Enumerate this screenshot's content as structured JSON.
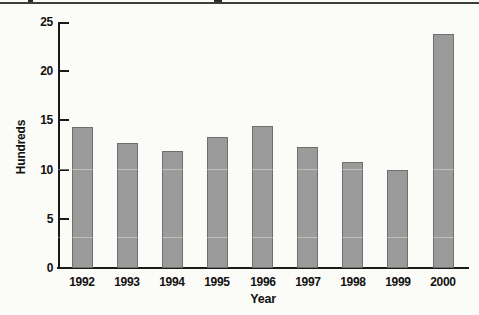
{
  "page": {
    "background_color": "#fbfbf8",
    "top_rule_color": "#3d3d3d"
  },
  "chart_data": {
    "type": "bar",
    "title": "",
    "categories": [
      "1992",
      "1993",
      "1994",
      "1995",
      "1996",
      "1997",
      "1998",
      "1999",
      "2000"
    ],
    "values": [
      14.3,
      12.7,
      11.9,
      13.3,
      14.4,
      12.3,
      10.8,
      10.0,
      23.8
    ],
    "xlabel": "Year",
    "ylabel": "Hundreds",
    "ylim": [
      0,
      25
    ],
    "yticks": [
      0,
      5,
      10,
      15,
      20,
      25
    ],
    "grid": false,
    "legend": "none",
    "bar_color": "#9b9b9b",
    "bar_border_color": "#6f6f6f",
    "axis_color": "#1a1a1a",
    "label_color": "#111111"
  }
}
